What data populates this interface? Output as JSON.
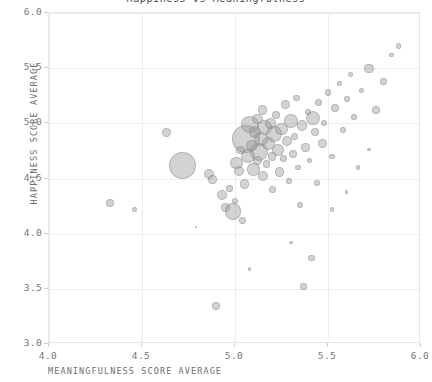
{
  "chart_data": {
    "type": "scatter",
    "title": "Happiness vs Meaningfulness",
    "xlabel": "MEANINGFULNESS SCORE AVERAGE",
    "ylabel": "HAPPINESS SCORE AVERAGE",
    "xlim": [
      4.0,
      6.0
    ],
    "ylim": [
      3.0,
      6.0
    ],
    "xticks": [
      "4.0",
      "4.5",
      "5.0",
      "5.5",
      "6.0"
    ],
    "xtick_values": [
      4.0,
      4.5,
      5.0,
      5.5,
      6.0
    ],
    "yticks": [
      "3.0",
      "3.5",
      "4.0",
      "4.5",
      "5.0",
      "5.5",
      "6.0"
    ],
    "ytick_values": [
      3.0,
      3.5,
      4.0,
      4.5,
      5.0,
      5.5,
      6.0
    ],
    "grid": true,
    "legend": null,
    "marker": "circle",
    "marker_fill": "#969696",
    "marker_opacity": 0.42,
    "marker_edge": "#787878",
    "size_encodes": "count",
    "points": [
      {
        "x": 4.33,
        "y": 4.28,
        "s": 4.0
      },
      {
        "x": 4.46,
        "y": 4.22,
        "s": 2.6
      },
      {
        "x": 4.63,
        "y": 4.92,
        "s": 4.6
      },
      {
        "x": 4.72,
        "y": 4.62,
        "s": 13.5
      },
      {
        "x": 4.86,
        "y": 4.54,
        "s": 5.2
      },
      {
        "x": 4.88,
        "y": 4.49,
        "s": 4.2
      },
      {
        "x": 4.9,
        "y": 3.34,
        "s": 4.0
      },
      {
        "x": 4.93,
        "y": 4.35,
        "s": 5.0
      },
      {
        "x": 4.95,
        "y": 4.24,
        "s": 4.4
      },
      {
        "x": 4.97,
        "y": 4.41,
        "s": 3.2
      },
      {
        "x": 4.99,
        "y": 4.2,
        "s": 8.2
      },
      {
        "x": 5.0,
        "y": 4.3,
        "s": 3.0
      },
      {
        "x": 5.01,
        "y": 4.64,
        "s": 6.4
      },
      {
        "x": 5.02,
        "y": 4.57,
        "s": 5.0
      },
      {
        "x": 5.03,
        "y": 4.76,
        "s": 4.2
      },
      {
        "x": 5.04,
        "y": 4.12,
        "s": 3.4
      },
      {
        "x": 5.05,
        "y": 4.45,
        "s": 4.8
      },
      {
        "x": 5.06,
        "y": 4.86,
        "s": 14.0
      },
      {
        "x": 5.07,
        "y": 4.7,
        "s": 7.0
      },
      {
        "x": 5.08,
        "y": 4.99,
        "s": 8.8
      },
      {
        "x": 5.09,
        "y": 4.8,
        "s": 5.6
      },
      {
        "x": 5.1,
        "y": 4.58,
        "s": 6.2
      },
      {
        "x": 5.11,
        "y": 4.92,
        "s": 6.0
      },
      {
        "x": 5.12,
        "y": 5.04,
        "s": 5.4
      },
      {
        "x": 5.12,
        "y": 4.66,
        "s": 4.4
      },
      {
        "x": 5.13,
        "y": 4.74,
        "s": 9.2
      },
      {
        "x": 5.14,
        "y": 4.86,
        "s": 6.8
      },
      {
        "x": 5.15,
        "y": 5.12,
        "s": 4.6
      },
      {
        "x": 5.15,
        "y": 4.52,
        "s": 5.0
      },
      {
        "x": 5.16,
        "y": 4.96,
        "s": 7.4
      },
      {
        "x": 5.17,
        "y": 4.63,
        "s": 3.8
      },
      {
        "x": 5.18,
        "y": 4.82,
        "s": 6.6
      },
      {
        "x": 5.19,
        "y": 5.0,
        "s": 5.2
      },
      {
        "x": 5.2,
        "y": 4.7,
        "s": 4.2
      },
      {
        "x": 5.2,
        "y": 4.4,
        "s": 3.6
      },
      {
        "x": 5.21,
        "y": 4.9,
        "s": 8.0
      },
      {
        "x": 5.22,
        "y": 5.08,
        "s": 4.0
      },
      {
        "x": 5.23,
        "y": 4.76,
        "s": 5.8
      },
      {
        "x": 5.24,
        "y": 4.56,
        "s": 4.8
      },
      {
        "x": 5.25,
        "y": 4.95,
        "s": 6.2
      },
      {
        "x": 5.26,
        "y": 4.68,
        "s": 3.4
      },
      {
        "x": 5.27,
        "y": 5.17,
        "s": 4.4
      },
      {
        "x": 5.28,
        "y": 4.84,
        "s": 5.0
      },
      {
        "x": 5.29,
        "y": 4.48,
        "s": 3.0
      },
      {
        "x": 5.3,
        "y": 5.02,
        "s": 6.8
      },
      {
        "x": 5.31,
        "y": 4.72,
        "s": 4.0
      },
      {
        "x": 5.32,
        "y": 4.88,
        "s": 3.6
      },
      {
        "x": 5.33,
        "y": 5.23,
        "s": 3.2
      },
      {
        "x": 5.34,
        "y": 4.6,
        "s": 2.8
      },
      {
        "x": 5.35,
        "y": 4.26,
        "s": 3.4
      },
      {
        "x": 5.36,
        "y": 4.98,
        "s": 5.4
      },
      {
        "x": 5.37,
        "y": 3.52,
        "s": 3.6
      },
      {
        "x": 5.38,
        "y": 4.78,
        "s": 4.2
      },
      {
        "x": 5.39,
        "y": 5.1,
        "s": 3.0
      },
      {
        "x": 5.4,
        "y": 4.66,
        "s": 2.6
      },
      {
        "x": 5.41,
        "y": 3.78,
        "s": 3.4
      },
      {
        "x": 5.42,
        "y": 5.05,
        "s": 7.2
      },
      {
        "x": 5.43,
        "y": 4.92,
        "s": 4.0
      },
      {
        "x": 5.44,
        "y": 4.46,
        "s": 3.2
      },
      {
        "x": 5.45,
        "y": 5.19,
        "s": 3.8
      },
      {
        "x": 5.47,
        "y": 4.82,
        "s": 4.6
      },
      {
        "x": 5.48,
        "y": 5.0,
        "s": 3.0
      },
      {
        "x": 5.5,
        "y": 5.28,
        "s": 3.4
      },
      {
        "x": 5.52,
        "y": 4.7,
        "s": 2.8
      },
      {
        "x": 5.54,
        "y": 5.14,
        "s": 4.0
      },
      {
        "x": 5.56,
        "y": 5.36,
        "s": 2.6
      },
      {
        "x": 5.58,
        "y": 4.94,
        "s": 3.2
      },
      {
        "x": 5.6,
        "y": 5.22,
        "s": 3.0
      },
      {
        "x": 5.62,
        "y": 5.44,
        "s": 2.4
      },
      {
        "x": 5.64,
        "y": 5.06,
        "s": 2.8
      },
      {
        "x": 5.66,
        "y": 4.6,
        "s": 2.2
      },
      {
        "x": 5.68,
        "y": 5.3,
        "s": 2.6
      },
      {
        "x": 5.72,
        "y": 5.5,
        "s": 4.6
      },
      {
        "x": 5.76,
        "y": 5.12,
        "s": 4.0
      },
      {
        "x": 5.8,
        "y": 5.38,
        "s": 3.4
      },
      {
        "x": 5.84,
        "y": 5.62,
        "s": 2.4
      },
      {
        "x": 5.88,
        "y": 5.7,
        "s": 2.8
      },
      {
        "x": 5.52,
        "y": 4.22,
        "s": 2.2
      },
      {
        "x": 5.3,
        "y": 3.92,
        "s": 1.8
      },
      {
        "x": 5.08,
        "y": 3.68,
        "s": 1.6
      },
      {
        "x": 4.79,
        "y": 4.06,
        "s": 1.4
      },
      {
        "x": 5.6,
        "y": 4.38,
        "s": 1.8
      },
      {
        "x": 5.72,
        "y": 4.76,
        "s": 1.6
      }
    ]
  }
}
